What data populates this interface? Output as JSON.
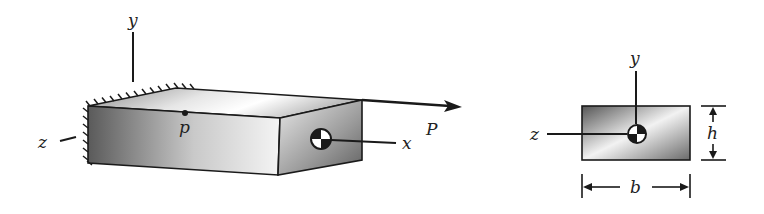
{
  "diagram": {
    "type": "cantilever-beam-axial-load",
    "left_view": {
      "description": "3D rectangular beam fixed at left wall, axial load P applied at centroid of free end",
      "labels": {
        "y_axis": "y",
        "z_axis": "z",
        "x_axis": "x",
        "point": "p",
        "load": "P"
      },
      "support": "fixed",
      "centroid_symbol": "centroid-icon"
    },
    "cross_section": {
      "description": "Rectangular cross-section with centroidal axes",
      "labels": {
        "y_axis": "y",
        "z_axis": "z",
        "height": "h",
        "width": "b"
      },
      "centroid_symbol": "centroid-icon"
    },
    "colors": {
      "line": "#1a1a1a",
      "shade_dark": "#555555",
      "shade_light": "#f4f4f4",
      "background": "#ffffff"
    }
  }
}
